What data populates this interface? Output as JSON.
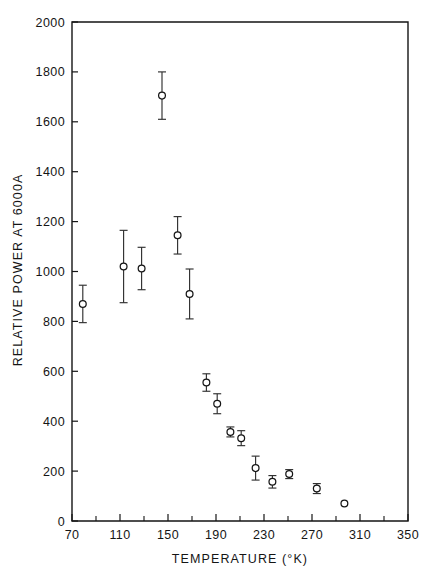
{
  "figure": {
    "title": "",
    "background": "#ffffff",
    "ink_color": "#151515"
  },
  "axes": {
    "x": {
      "label": "TEMPERATURE (°K)",
      "min": 70,
      "max": 350,
      "major_ticks": [
        70,
        110,
        150,
        190,
        230,
        270,
        310,
        350
      ],
      "major_tick_labels": [
        "70",
        "110",
        "150",
        "190",
        "230",
        "270",
        "310",
        "350"
      ],
      "minor_ticks": [
        90,
        130,
        170,
        210,
        250,
        290,
        330
      ]
    },
    "y": {
      "label": "RELATIVE POWER AT 6000A",
      "min": 0,
      "max": 2000,
      "major_ticks": [
        0,
        200,
        400,
        600,
        800,
        1000,
        1200,
        1400,
        1600,
        1800,
        2000
      ],
      "major_tick_labels": [
        "0",
        "200",
        "400",
        "600",
        "800",
        "1000",
        "1200",
        "1400",
        "1600",
        "1800",
        "2000"
      ]
    },
    "frame": "box",
    "grid": false
  },
  "chart_data": {
    "type": "scatter",
    "title": "",
    "xlabel": "TEMPERATURE (°K)",
    "ylabel": "RELATIVE POWER AT 6000A",
    "xlim": [
      70,
      350
    ],
    "ylim": [
      0,
      2000
    ],
    "grid": false,
    "legend": null,
    "marker": "open-circle",
    "error_bars": "y",
    "series": [
      {
        "name": "relative power",
        "x": [
          79,
          113,
          128,
          145,
          158,
          168,
          182,
          191,
          202,
          211,
          223,
          237,
          251,
          274,
          297
        ],
        "y": [
          870,
          1020,
          1012,
          1705,
          1145,
          910,
          555,
          470,
          357,
          332,
          212,
          157,
          188,
          130,
          70
        ],
        "yerr": [
          75,
          145,
          85,
          95,
          75,
          100,
          35,
          40,
          20,
          30,
          48,
          25,
          18,
          20,
          0
        ]
      }
    ]
  }
}
